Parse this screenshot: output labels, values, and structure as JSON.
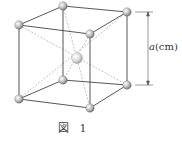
{
  "figure": {
    "caption_prefix": "図",
    "caption_number": "1",
    "dimension_label_var": "a",
    "dimension_label_unit": "(cm)"
  },
  "structure": {
    "type": "body-centered cubic unit cell",
    "atoms": [
      {
        "name": "top-back-left",
        "x": 63,
        "y": 6
      },
      {
        "name": "top-back-right",
        "x": 127,
        "y": 12
      },
      {
        "name": "top-front-left",
        "x": 19,
        "y": 25
      },
      {
        "name": "top-front-right",
        "x": 90,
        "y": 34
      },
      {
        "name": "center",
        "x": 77,
        "y": 58
      },
      {
        "name": "bottom-back-left",
        "x": 63,
        "y": 80
      },
      {
        "name": "bottom-back-right",
        "x": 127,
        "y": 85
      },
      {
        "name": "bottom-front-left",
        "x": 19,
        "y": 99
      },
      {
        "name": "bottom-front-right",
        "x": 90,
        "y": 108
      }
    ]
  }
}
